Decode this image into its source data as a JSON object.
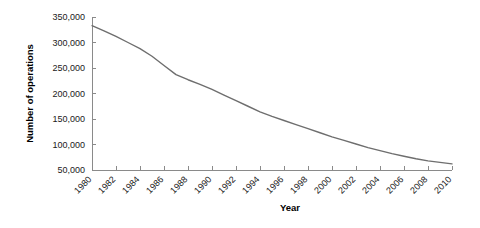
{
  "chart_data": {
    "type": "line",
    "title": "",
    "xlabel": "Year",
    "ylabel": "Number of operations",
    "xlim": [
      1980,
      2010
    ],
    "ylim": [
      50000,
      350000
    ],
    "grid": false,
    "legend": null,
    "line_color": "#6e6e6e",
    "axis_color": "#8a8a8a",
    "text_color": "#1a1a1a",
    "background_color": "#ffffff",
    "ytick_labels": [
      "350,000",
      "300,000",
      "250,000",
      "200,000",
      "150,000",
      "100,000",
      "50,000"
    ],
    "ytick_values": [
      350000,
      300000,
      250000,
      200000,
      150000,
      100000,
      50000
    ],
    "xtick_labels": [
      "1980",
      "1982",
      "1984",
      "1986",
      "1988",
      "1990",
      "1992",
      "1994",
      "1996",
      "1998",
      "2000",
      "2002",
      "2004",
      "2006",
      "2008",
      "2010"
    ],
    "xtick_values": [
      1980,
      1982,
      1984,
      1986,
      1988,
      1990,
      1992,
      1994,
      1996,
      1998,
      2000,
      2002,
      2004,
      2006,
      2008,
      2010
    ],
    "x": [
      1980,
      1981,
      1982,
      1983,
      1984,
      1985,
      1986,
      1987,
      1988,
      1989,
      1990,
      1991,
      1992,
      1993,
      1994,
      1995,
      1996,
      1997,
      1998,
      1999,
      2000,
      2001,
      2002,
      2003,
      2004,
      2005,
      2006,
      2007,
      2008,
      2009,
      2010
    ],
    "values": [
      333000,
      323000,
      312000,
      300000,
      288000,
      273000,
      255000,
      237000,
      227000,
      218000,
      208000,
      197000,
      186000,
      175000,
      164000,
      155000,
      147000,
      139000,
      131000,
      123000,
      115000,
      108000,
      101000,
      94000,
      88000,
      82000,
      77000,
      72000,
      68000,
      65000,
      62000
    ]
  }
}
